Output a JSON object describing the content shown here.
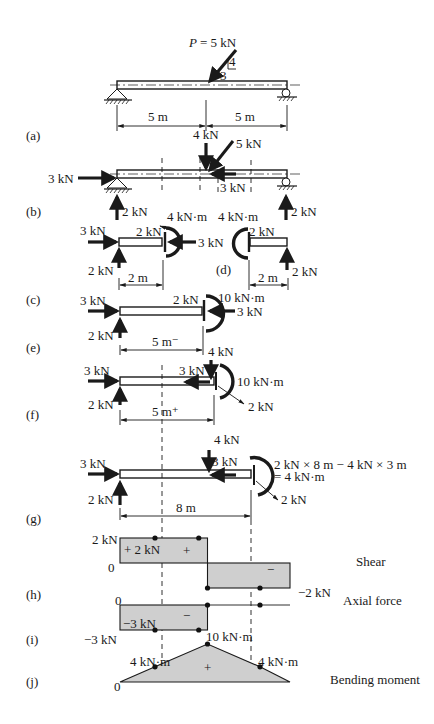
{
  "figure": {
    "panel_labels": [
      "(a)",
      "(b)",
      "(c)",
      "(d)",
      "(e)",
      "(f)",
      "(g)",
      "(h)",
      "(i)",
      "(j)"
    ],
    "a": {
      "load_label": "P",
      "load_value": "= 5 kN",
      "slope_rise": "4",
      "slope_run": "3",
      "span_left": "5 m",
      "span_right": "5 m"
    },
    "b": {
      "vertical_component": "4 kN",
      "inclined_load": "5 kN",
      "horizontal_reaction": "3 kN",
      "horizontal_component": "3 kN",
      "left_reaction": "2 kN",
      "right_reaction": "2 kN"
    },
    "c": {
      "axial_left": "3 kN",
      "reaction": "2 kN",
      "shear": "2 kN",
      "moment": "4 kN·m",
      "axial_right": "3 kN",
      "length": "2 m"
    },
    "d": {
      "moment": "4 kN·m",
      "shear": "2 kN",
      "reaction": "2 kN",
      "length": "2 m"
    },
    "e": {
      "axial_left": "3 kN",
      "reaction": "2 kN",
      "shear": "2 kN",
      "moment": "10 kN·m",
      "axial_right": "3 kN",
      "length": "5 m⁻"
    },
    "f": {
      "axial_left": "3 kN",
      "reaction": "2 kN",
      "vertical_load": "4 kN",
      "horizontal_load": "3 kN",
      "moment": "10 kN·m",
      "section_force": "2 kN",
      "length": "5 m⁺"
    },
    "g": {
      "axial_left": "3 kN",
      "reaction": "2 kN",
      "vertical_load": "4 kN",
      "horizontal_load": "3 kN",
      "moment_line1": "2 kN × 8 m − 4 kN × 3 m",
      "moment_line2": "= 4 kN·m",
      "section_force": "2 kN",
      "length": "8 m"
    },
    "h": {
      "title": "Shear",
      "top_value": "2 kN",
      "zero": "0",
      "inner_value": "+ 2 kN",
      "pos_sign": "+",
      "neg_sign": "−",
      "bottom_value": "−2 kN"
    },
    "i": {
      "title": "Axial force",
      "zero": "0",
      "inner_value": "−3 kN",
      "neg_sign": "−",
      "bottom_value": "−3 kN"
    },
    "j": {
      "title": "Bending moment",
      "peak_value": "10 kN·m",
      "left_value": "4 kN·m",
      "right_value": "4 kN·m",
      "pos_sign": "+",
      "zero": "0"
    }
  },
  "chart_data": [
    {
      "type": "line",
      "title": "Shear",
      "x": [
        0,
        5,
        5,
        10
      ],
      "y": [
        2,
        2,
        -2,
        -2
      ],
      "units": "kN",
      "marked_points": [
        [
          2,
          2
        ],
        [
          4.5,
          2
        ],
        [
          5,
          -2
        ],
        [
          8,
          -2
        ]
      ]
    },
    {
      "type": "line",
      "title": "Axial force",
      "x": [
        0,
        5,
        5,
        10
      ],
      "y": [
        -3,
        -3,
        0,
        0
      ],
      "units": "kN",
      "marked_points": [
        [
          2,
          -3
        ],
        [
          4.5,
          -3
        ],
        [
          5,
          0
        ],
        [
          8,
          0
        ]
      ]
    },
    {
      "type": "line",
      "title": "Bending moment",
      "x": [
        0,
        2,
        5,
        8,
        10
      ],
      "y": [
        0,
        4,
        10,
        4,
        0
      ],
      "units": "kN·m",
      "marked_points": [
        [
          2,
          4
        ],
        [
          5,
          10
        ],
        [
          8,
          4
        ]
      ]
    }
  ]
}
